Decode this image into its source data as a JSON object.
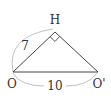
{
  "diagram": {
    "type": "geometry-triangle",
    "points": {
      "O": {
        "label": "O",
        "x": 13,
        "y": 72
      },
      "H": {
        "label": "H",
        "x": 55,
        "y": 32
      },
      "O_prime": {
        "label": "O'",
        "x": 98,
        "y": 72
      }
    },
    "segments": [
      {
        "from": "O",
        "to": "H",
        "length_label": "7"
      },
      {
        "from": "H",
        "to": "O_prime",
        "length_label": ""
      },
      {
        "from": "O",
        "to": "O_prime",
        "length_label": "10"
      }
    ],
    "right_angle_at": "H",
    "colors": {
      "line": "#444444",
      "arc": "#aaaaaa",
      "text": "#333333"
    }
  }
}
